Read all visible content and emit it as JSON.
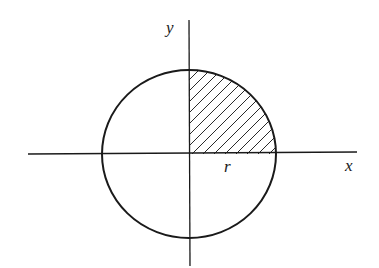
{
  "diagram": {
    "type": "circle-quadrant",
    "labels": {
      "y_axis": "y",
      "x_axis": "x",
      "radius": "r"
    },
    "shaded_region": "first-quadrant",
    "colors": {
      "stroke": "#1a1a1a",
      "hatch": "#2a2a2a",
      "background": "#ffffff"
    }
  }
}
